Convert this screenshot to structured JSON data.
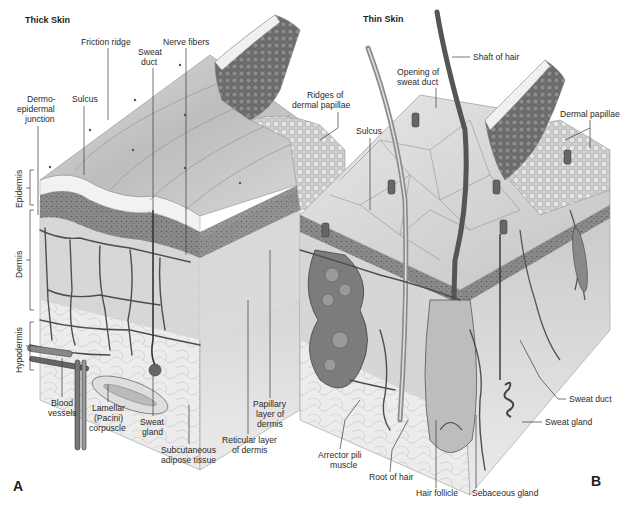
{
  "figure": {
    "panels": [
      {
        "id": "A",
        "panel_letter": "A",
        "title": "Thick Skin",
        "labels": {
          "friction_ridge": "Friction ridge",
          "nerve_fibers": "Nerve fibers",
          "sweat_duct": [
            "Sweat",
            "duct"
          ],
          "sulcus": "Sulcus",
          "dermo_epidermal_junction": [
            "Dermo-",
            "epidermal",
            "junction"
          ],
          "ridges_of_dermal_papillae": [
            "Ridges of",
            "dermal papillae"
          ],
          "blood_vessels": [
            "Blood",
            "vessels"
          ],
          "lamellar_corpuscle": [
            "Lamellar",
            "(Pacini)",
            "corpuscle"
          ],
          "sweat_gland": [
            "Sweat",
            "gland"
          ],
          "subcutaneous_adipose_tissue": [
            "Subcutaneous",
            "adipose tissue"
          ],
          "reticular_layer": [
            "Reticular layer",
            "of dermis"
          ],
          "papillary_layer": [
            "Papillary",
            "layer of",
            "dermis"
          ]
        },
        "layers": [
          "Epidermis",
          "Dermis",
          "Hypodermis"
        ]
      },
      {
        "id": "B",
        "panel_letter": "B",
        "title": "Thin Skin",
        "labels": {
          "shaft_of_hair": "Shaft of hair",
          "opening_of_sweat_duct": [
            "Opening of",
            "sweat duct"
          ],
          "sulcus": "Sulcus",
          "dermal_papillae": "Dermal papillae",
          "sweat_duct": "Sweat duct",
          "sweat_gland": "Sweat gland",
          "arrector_pili_muscle": [
            "Arrector pili",
            "muscle"
          ],
          "root_of_hair": "Root of hair",
          "hair_follicle": "Hair follicle",
          "sebaceous_gland": "Sebaceous gland"
        }
      }
    ],
    "colors": {
      "background": "#ffffff",
      "skin_surface": "#d9d9d9",
      "skin_shadow": "#a8a8a8",
      "epidermis_dark": "#7a7a7a",
      "dermis": "#cfcfcf",
      "hypodermis": "#e6e6e6",
      "vessel": "#555555",
      "text": "#2a2a2a"
    }
  }
}
